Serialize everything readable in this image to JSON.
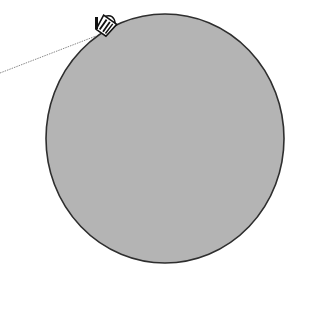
{
  "canvas": {
    "background": "#ffffff",
    "shape": {
      "type": "ellipse",
      "cx": 165,
      "cy": 138.5,
      "rx": 119,
      "ry": 124.5,
      "fill": "#b4b4b4",
      "stroke": "#2e2e2e"
    },
    "guide_line": {
      "x1": 0,
      "y1": 73,
      "x2": 96,
      "y2": 36,
      "stroke": "#8a8a8a"
    },
    "cursor": {
      "icon": "paint-bucket-icon",
      "x": 95,
      "y": 13
    }
  }
}
